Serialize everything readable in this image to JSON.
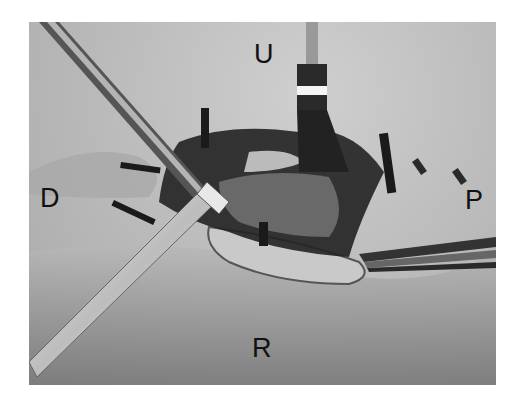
{
  "figure": {
    "type": "grayscale surgical photograph",
    "labels": {
      "top": "U",
      "left": "D",
      "right": "P",
      "bottom": "R"
    },
    "colors": {
      "background": "#ffffff",
      "tissue_light": "#c8c8c8",
      "tissue_dark": "#8a8a8a",
      "wound": "#1e1e1e",
      "label": "#111111"
    }
  }
}
